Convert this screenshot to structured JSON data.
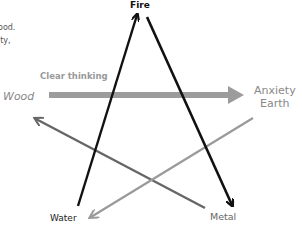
{
  "diagram": {
    "fragments": [
      "ood.",
      "ity,"
    ],
    "nodes": {
      "fire": "Fire",
      "wood": "Wood",
      "anxiety": "Anxiety",
      "earth": "Earth",
      "water": "Water",
      "metal": "Metal"
    },
    "edges": [
      {
        "from": "Water",
        "to": "Fire",
        "color": "#111111"
      },
      {
        "from": "Fire",
        "to": "Metal",
        "color": "#111111"
      },
      {
        "from": "Wood",
        "to": "Earth",
        "label": "Clear thinking",
        "color": "#999999"
      },
      {
        "from": "Metal",
        "to": "Wood",
        "color": "#666666"
      },
      {
        "from": "Earth",
        "to": "Water",
        "color": "#9a9a9a"
      }
    ],
    "edge_label": "Clear thinking"
  }
}
